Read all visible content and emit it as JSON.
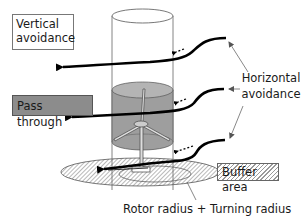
{
  "diagram": {
    "labels": {
      "vertical_avoidance_line1": "Vertical",
      "vertical_avoidance_line2": "avoidance",
      "pass_through": "Pass through",
      "horizontal_avoidance_line1": "Horizontal",
      "horizontal_avoidance_line2": "avoidance",
      "buffer_area": "Buffer area",
      "rotor_turning": "Rotor radius + Turning radius"
    },
    "colors": {
      "pass_through_fill": "#8c8c8c",
      "rotor_zone_fill": "#9e9e9e",
      "arrow": "#000000",
      "pointer_line": "#555555"
    },
    "elements": {
      "outer_cylinder": "safety-zone-cylinder",
      "inner_cylinder": "rotor-swept-zone",
      "turbine": "wind-turbine-icon",
      "buffer_ellipse": "hatched-buffer-ellipse",
      "flight_arrows": [
        "upper-avoidance-arrow",
        "middle-pass-arrow",
        "lower-avoidance-arrow"
      ]
    }
  }
}
